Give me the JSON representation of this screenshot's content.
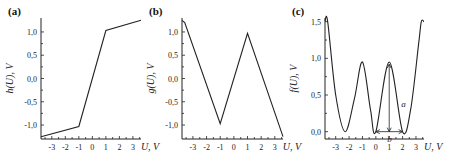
{
  "chart_data": [
    {
      "panel_label": "(a)",
      "type": "line",
      "title": "",
      "xlabel": "U, V",
      "ylabel": "h(U), V",
      "xlim": [
        -3.8,
        3.6
      ],
      "ylim": [
        -1.3,
        1.3
      ],
      "xticks": [
        "-3",
        "-2",
        "-1",
        "0",
        "1",
        "2",
        "3"
      ],
      "yticks": [
        "-1,0",
        "-0,5",
        "0,0",
        "0,5",
        "1,0"
      ],
      "grid": false,
      "series": [
        {
          "name": "h(U)",
          "x": [
            -3.8,
            -1.0,
            1.0,
            3.6
          ],
          "y": [
            -1.25,
            -1.03,
            1.03,
            1.25
          ]
        }
      ]
    },
    {
      "panel_label": "(b)",
      "type": "line",
      "title": "",
      "xlabel": "U, V",
      "ylabel": "g(U), V",
      "xlim": [
        -3.8,
        3.6
      ],
      "ylim": [
        -1.3,
        1.3
      ],
      "xticks": [
        "-3",
        "-2",
        "-1",
        "0",
        "1",
        "2",
        "3"
      ],
      "yticks": [
        "-1,0",
        "-0,5",
        "0,0",
        "0,5",
        "1,0"
      ],
      "grid": false,
      "series": [
        {
          "name": "g(U)",
          "x": [
            -3.8,
            -3.6,
            -1.0,
            1.0,
            3.6
          ],
          "y": [
            1.25,
            1.2,
            -0.97,
            0.97,
            -1.25
          ]
        }
      ]
    },
    {
      "panel_label": "(c)",
      "type": "line",
      "title": "",
      "xlabel": "U, V",
      "ylabel": "f(U), V",
      "xlim": [
        -3.8,
        3.6
      ],
      "ylim": [
        -0.1,
        1.55
      ],
      "xticks": [
        "-3",
        "-2",
        "-1",
        "0",
        "1",
        "2",
        "3"
      ],
      "yticks": [
        "0,0",
        "0,5",
        "1,0",
        "1,5"
      ],
      "grid": false,
      "series": [
        {
          "name": "f(U)",
          "x": [
            -3.8,
            -3.6,
            -3.0,
            -2.3,
            -1.6,
            -1.0,
            -0.4,
            0.0,
            1.0,
            2.0,
            2.6,
            3.2,
            3.4,
            3.6
          ],
          "y": [
            1.5,
            1.5,
            0.5,
            0.0,
            0.45,
            0.95,
            0.3,
            0.0,
            0.95,
            0.0,
            0.3,
            1.2,
            1.5,
            1.5
          ]
        }
      ],
      "annotations": [
        {
          "text": "a",
          "description": "vertical double arrow from f=0 to peak at U=1"
        },
        {
          "text": "b",
          "description": "horizontal double arrow between minima at U≈0 and U≈2"
        }
      ]
    }
  ]
}
